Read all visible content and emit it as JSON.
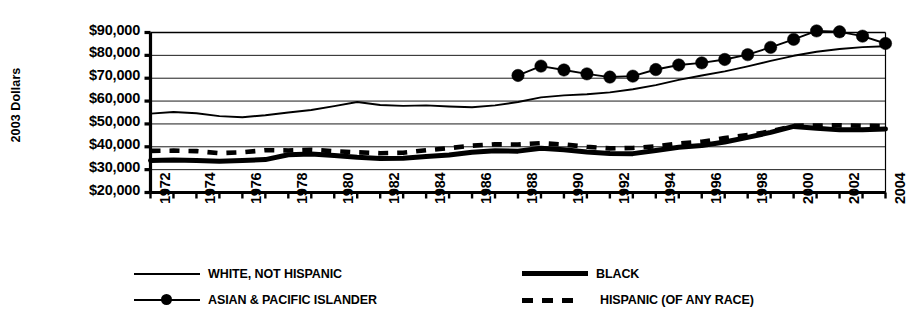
{
  "chart_data": {
    "type": "line",
    "title": "",
    "xlabel": "",
    "ylabel": "2003 Dollars",
    "ylim": [
      20000,
      90000
    ],
    "ytick_step": 10000,
    "ytick_labels": [
      "$90,000",
      "$80,000",
      "$70,000",
      "$60,000",
      "$50,000",
      "$40,000",
      "$30,000",
      "$20,000"
    ],
    "ytick_values": [
      90000,
      80000,
      70000,
      60000,
      50000,
      40000,
      30000,
      20000
    ],
    "xlim": [
      1972,
      2004
    ],
    "x": [
      1972,
      1973,
      1974,
      1975,
      1976,
      1977,
      1978,
      1979,
      1980,
      1981,
      1982,
      1983,
      1984,
      1985,
      1986,
      1987,
      1988,
      1989,
      1990,
      1991,
      1992,
      1993,
      1994,
      1995,
      1996,
      1997,
      1998,
      1999,
      2000,
      2001,
      2002,
      2003,
      2004
    ],
    "xtick_labels": [
      "1972",
      "1974",
      "1976",
      "1978",
      "1980",
      "1982",
      "1984",
      "1986",
      "1988",
      "1990",
      "1992",
      "1994",
      "1996",
      "1998",
      "2000",
      "2002",
      "2004"
    ],
    "xtick_values": [
      1972,
      1974,
      1976,
      1978,
      1980,
      1982,
      1984,
      1986,
      1988,
      1990,
      1992,
      1994,
      1996,
      1998,
      2000,
      2002,
      2004
    ],
    "grid": "horizontal",
    "legend_position": "bottom",
    "series": [
      {
        "name": "WHITE, NOT HISPANIC",
        "style": "thin-line",
        "color": "#000000",
        "x": [
          1972,
          1973,
          1974,
          1975,
          1976,
          1977,
          1978,
          1979,
          1980,
          1981,
          1982,
          1983,
          1984,
          1985,
          1986,
          1987,
          1988,
          1989,
          1990,
          1991,
          1992,
          1993,
          1994,
          1995,
          1996,
          1997,
          1998,
          1999,
          2000,
          2001,
          2002,
          2003,
          2004
        ],
        "values": [
          54500,
          55200,
          54700,
          53400,
          52900,
          53800,
          55000,
          56100,
          57800,
          59600,
          58300,
          57900,
          58100,
          57600,
          57300,
          58100,
          59600,
          61600,
          62500,
          63000,
          63800,
          65200,
          67000,
          69300,
          71200,
          73000,
          75200,
          77600,
          79800,
          81600,
          82800,
          83600,
          84000
        ]
      },
      {
        "name": "ASIAN & PACIFIC ISLANDER",
        "style": "line-with-markers",
        "color": "#000000",
        "x": [
          1988,
          1989,
          1990,
          1991,
          1992,
          1993,
          1994,
          1995,
          1996,
          1997,
          1998,
          1999,
          2000,
          2001,
          2002,
          2003,
          2004
        ],
        "values": [
          71200,
          75300,
          73600,
          71900,
          70500,
          70900,
          73800,
          75800,
          76700,
          78200,
          80300,
          83500,
          87000,
          90700,
          90300,
          88400,
          85200
        ]
      },
      {
        "name": "BLACK",
        "style": "thick-line",
        "color": "#000000",
        "x": [
          1972,
          1973,
          1974,
          1975,
          1976,
          1977,
          1978,
          1979,
          1980,
          1981,
          1982,
          1983,
          1984,
          1985,
          1986,
          1987,
          1988,
          1989,
          1990,
          1991,
          1992,
          1993,
          1994,
          1995,
          1996,
          1997,
          1998,
          1999,
          2000,
          2001,
          2002,
          2003,
          2004
        ],
        "values": [
          34000,
          34200,
          34000,
          33700,
          34000,
          34400,
          36500,
          36800,
          36200,
          35400,
          34900,
          35000,
          35700,
          36400,
          37600,
          38300,
          38100,
          39400,
          38700,
          37700,
          37100,
          37000,
          38400,
          39800,
          40600,
          42100,
          44100,
          46300,
          48900,
          48100,
          47400,
          47500,
          47800
        ]
      },
      {
        "name": "HISPANIC (OF ANY RACE)",
        "style": "thick-dashed",
        "color": "#000000",
        "x": [
          1972,
          1973,
          1974,
          1975,
          1976,
          1977,
          1978,
          1979,
          1980,
          1981,
          1982,
          1983,
          1984,
          1985,
          1986,
          1987,
          1988,
          1989,
          1990,
          1991,
          1992,
          1993,
          1994,
          1995,
          1996,
          1997,
          1998,
          1999,
          2000,
          2001,
          2002,
          2003,
          2004
        ],
        "values": [
          38200,
          38300,
          38100,
          37200,
          37600,
          38500,
          38400,
          38700,
          38100,
          37600,
          37200,
          37400,
          38500,
          39400,
          40500,
          41100,
          41000,
          41600,
          41000,
          40000,
          39300,
          39500,
          40200,
          41400,
          42200,
          43800,
          45100,
          46700,
          49200,
          49300,
          49400,
          49200,
          49000
        ]
      }
    ]
  },
  "legend": {
    "entries": [
      {
        "label": "WHITE, NOT HISPANIC",
        "style": "thin-line"
      },
      {
        "label": "BLACK",
        "style": "thick-line"
      },
      {
        "label": "ASIAN & PACIFIC ISLANDER",
        "style": "line-with-markers"
      },
      {
        "label": "HISPANIC (OF ANY RACE)",
        "style": "thick-dashed"
      }
    ]
  }
}
